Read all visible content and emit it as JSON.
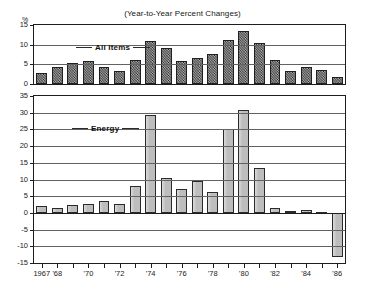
{
  "header": {
    "title": "(Year-to-Year Percent Changes)"
  },
  "axis": {
    "unit_label": "%",
    "x_tick_labels": [
      "1967",
      "'68",
      "",
      "'70",
      "",
      "'72",
      "",
      "'74",
      "",
      "'76",
      "",
      "'78",
      "",
      "'80",
      "",
      "'82",
      "",
      "'84",
      "",
      "'86"
    ]
  },
  "panels": {
    "top": {
      "series_label": "All Items",
      "y_ticks": [
        "15",
        "10",
        "5",
        "0"
      ]
    },
    "bottom": {
      "series_label": "Energy",
      "y_ticks": [
        "35",
        "30",
        "25",
        "20",
        "15",
        "10",
        "5",
        "0",
        "-5",
        "-10",
        "-15"
      ]
    }
  },
  "chart_data": [
    {
      "type": "bar",
      "title": "(Year-to-Year Percent Changes)",
      "series_name": "All Items",
      "xlabel": "",
      "ylabel": "%",
      "ylim": [
        0,
        15
      ],
      "yticks": [
        0,
        5,
        10,
        15
      ],
      "grid": true,
      "legend": "inline-label",
      "categories": [
        "1967",
        "1968",
        "1969",
        "1970",
        "1971",
        "1972",
        "1973",
        "1974",
        "1975",
        "1976",
        "1977",
        "1978",
        "1979",
        "1980",
        "1981",
        "1982",
        "1983",
        "1984",
        "1985",
        "1986"
      ],
      "xtick_labels": [
        "1967",
        "'68",
        "'70",
        "'72",
        "'74",
        "'76",
        "'78",
        "'80",
        "'82",
        "'84",
        "'86"
      ],
      "values": [
        2.8,
        4.2,
        5.4,
        5.9,
        4.3,
        3.3,
        6.2,
        11.0,
        9.1,
        5.8,
        6.5,
        7.6,
        11.3,
        13.5,
        10.3,
        6.2,
        3.2,
        4.3,
        3.6,
        1.9
      ]
    },
    {
      "type": "bar",
      "title": "(Year-to-Year Percent Changes)",
      "series_name": "Energy",
      "xlabel": "",
      "ylabel": "%",
      "ylim": [
        -15,
        35
      ],
      "yticks": [
        -15,
        -10,
        -5,
        0,
        5,
        10,
        15,
        20,
        25,
        30,
        35
      ],
      "grid": true,
      "legend": "inline-label",
      "categories": [
        "1967",
        "1968",
        "1969",
        "1970",
        "1971",
        "1972",
        "1973",
        "1974",
        "1975",
        "1976",
        "1977",
        "1978",
        "1979",
        "1980",
        "1981",
        "1982",
        "1983",
        "1984",
        "1985",
        "1986"
      ],
      "xtick_labels": [
        "1967",
        "'68",
        "'70",
        "'72",
        "'74",
        "'76",
        "'78",
        "'80",
        "'82",
        "'84",
        "'86"
      ],
      "values": [
        2.2,
        1.5,
        2.5,
        2.6,
        3.5,
        2.6,
        8.0,
        29.2,
        10.5,
        7.1,
        9.5,
        6.3,
        25.2,
        30.8,
        13.5,
        1.4,
        0.6,
        0.8,
        0.4,
        -13.2
      ]
    }
  ]
}
